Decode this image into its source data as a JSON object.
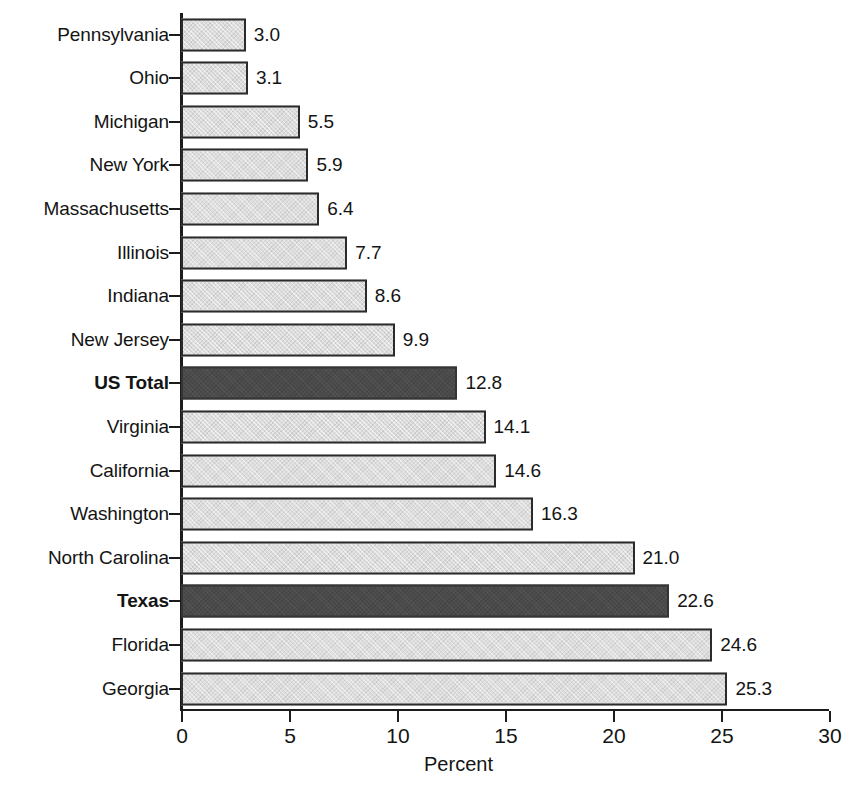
{
  "chart_data": {
    "type": "bar",
    "orientation": "horizontal",
    "title": "",
    "xlabel": "Percent",
    "ylabel": "",
    "xlim": [
      0,
      30
    ],
    "xticks": [
      0,
      5,
      10,
      15,
      20,
      25,
      30
    ],
    "xtick_labels": [
      "0",
      "5",
      "10",
      "15",
      "20",
      "25",
      "30"
    ],
    "grid": false,
    "legend": null,
    "categories": [
      "Pennsylvania",
      "Ohio",
      "Michigan",
      "New York",
      "Massachusetts",
      "Illinois",
      "Indiana",
      "New Jersey",
      "US Total",
      "Virginia",
      "California",
      "Washington",
      "North Carolina",
      "Texas",
      "Florida",
      "Georgia"
    ],
    "values": [
      3.0,
      3.1,
      5.5,
      5.9,
      6.4,
      7.7,
      8.6,
      9.9,
      12.8,
      14.1,
      14.6,
      16.3,
      21.0,
      22.6,
      24.6,
      25.3
    ],
    "value_labels": [
      "3.0",
      "3.1",
      "5.5",
      "5.9",
      "6.4",
      "7.7",
      "8.6",
      "9.9",
      "12.8",
      "14.1",
      "14.6",
      "16.3",
      "21.0",
      "22.6",
      "24.6",
      "25.3"
    ],
    "highlighted": [
      "US Total",
      "Texas"
    ],
    "colors": {
      "bar_light": "#dcdcdc",
      "bar_dark": "#4a4a4a",
      "bar_border": "#2b2b2b",
      "axis": "#1c1c1c",
      "text": "#141414",
      "background": "#ffffff"
    }
  }
}
